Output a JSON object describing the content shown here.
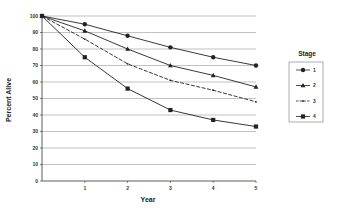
{
  "chart_data": {
    "type": "line",
    "title": "",
    "xlabel": "Year",
    "ylabel": "Percent Alive",
    "x": [
      0,
      1,
      2,
      3,
      4,
      5
    ],
    "x_tick_labels": [
      "1",
      "2",
      "3",
      "4",
      "5"
    ],
    "y_tick_labels": [
      "0",
      "10",
      "20",
      "30",
      "40",
      "50",
      "60",
      "70",
      "80",
      "90",
      "100"
    ],
    "ylim": [
      0,
      100
    ],
    "xlim": [
      0,
      5
    ],
    "grid": "horizontal",
    "legend": {
      "title": "Stage",
      "position": "right"
    },
    "series": [
      {
        "name": "1",
        "marker": "circle",
        "values": [
          100,
          95,
          88,
          81,
          75,
          70
        ]
      },
      {
        "name": "2",
        "marker": "triangle",
        "values": [
          100,
          91,
          80,
          70,
          64,
          57
        ]
      },
      {
        "name": "3",
        "marker": "dot",
        "dashed": true,
        "values": [
          100,
          86,
          71,
          61,
          55,
          48
        ]
      },
      {
        "name": "4",
        "marker": "square",
        "values": [
          100,
          75,
          56,
          43,
          37,
          33
        ]
      }
    ]
  },
  "colors": {
    "line": "#222222",
    "grid": "#999999",
    "axis": "#333333"
  }
}
